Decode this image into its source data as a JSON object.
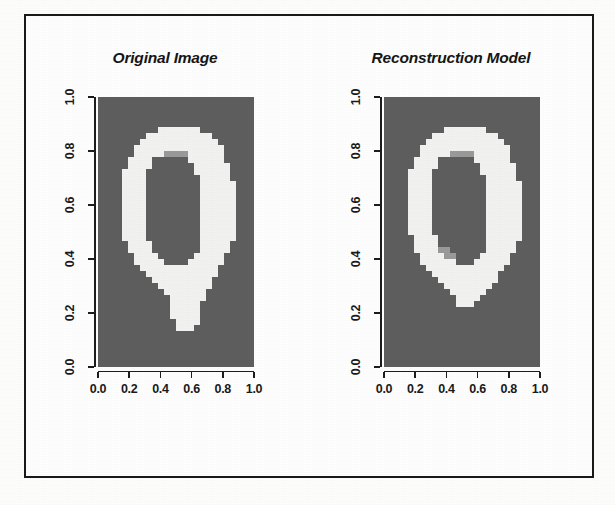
{
  "figure": {
    "panels": [
      {
        "id": "original",
        "title": "Original Image",
        "x_axis": {
          "ticks": [
            "0.0",
            "0.2",
            "0.4",
            "0.6",
            "0.8",
            "1.0"
          ],
          "min": 0.0,
          "max": 1.0
        },
        "y_axis": {
          "ticks": [
            "0.0",
            "0.2",
            "0.4",
            "0.6",
            "0.8",
            "1.0"
          ],
          "min": 0.0,
          "max": 1.0
        }
      },
      {
        "id": "reconstruction",
        "title": "Reconstruction Model",
        "x_axis": {
          "ticks": [
            "0.0",
            "0.2",
            "0.4",
            "0.6",
            "0.8",
            "1.0"
          ],
          "min": 0.0,
          "max": 1.0
        },
        "y_axis": {
          "ticks": [
            "0.0",
            "0.2",
            "0.4",
            "0.6",
            "0.8",
            "1.0"
          ],
          "min": 0.0,
          "max": 1.0
        }
      }
    ]
  },
  "colors": {
    "background_gray": "#5e5e5e",
    "stroke_white": "#f2f2f0",
    "stroke_mid": "#9a9a9a",
    "frame_black": "#1a1a1a",
    "page_white": "#fdfdfc"
  },
  "chart_data": {
    "type": "heatmap",
    "title": "",
    "xlabel": "",
    "ylabel": "",
    "xlim": [
      0.0,
      1.0
    ],
    "ylim": [
      0.0,
      1.0
    ],
    "grid": false,
    "legend": "none",
    "panels": [
      {
        "name": "Original Image",
        "x_ticks": [
          0.0,
          0.2,
          0.4,
          0.6,
          0.8,
          1.0
        ],
        "y_ticks": [
          0.0,
          0.2,
          0.4,
          0.6,
          0.8,
          1.0
        ],
        "grid_size": [
          26,
          45
        ],
        "value_levels": {
          "background": 0.0,
          "mid": 0.5,
          "stroke": 1.0
        },
        "pixels": [
          "00000000000000000000000000",
          "00000000000000000000000000",
          "00000000000000000000000000",
          "00000000000000000000000000",
          "00000000000000000000000000",
          "00000000001111111000000000",
          "00000000111111111110000000",
          "00000001111111111111000000",
          "00000011111111111111100000",
          "00000011111555511111100000",
          "00000111100000011111100000",
          "00000111100000001111110000",
          "00001111000000001111110000",
          "00001111000000000111110000",
          "00001111000000000111111000",
          "00001111000000000111111000",
          "00001111000000000111111000",
          "00001111000000000111111000",
          "00001111000000000111111000",
          "00001111000000000111111000",
          "00001111000000000111111000",
          "00001111000000000111111000",
          "00001111000000000111111000",
          "00001111000000000111111000",
          "00000111100000000111110000",
          "00000111100000000111110000",
          "00000011110000001111100000",
          "00000011111000011111100000",
          "00000001111111111111000000",
          "00000000111111111111000000",
          "00000000011111111110000000",
          "00000000001111111110000000",
          "00000000000111111100000000",
          "00000000000011111100000000",
          "00000000000011111000000000",
          "00000000000011111000000000",
          "00000000000011111000000000",
          "00000000000001111000000000",
          "00000000000001110000000000",
          "00000000000000000000000000",
          "00000000000000000000000000",
          "00000000000000000000000000",
          "00000000000000000000000000",
          "00000000000000000000000000",
          "00000000000000000000000000"
        ]
      },
      {
        "name": "Reconstruction Model",
        "x_ticks": [
          0.0,
          0.2,
          0.4,
          0.6,
          0.8,
          1.0
        ],
        "y_ticks": [
          0.0,
          0.2,
          0.4,
          0.6,
          0.8,
          1.0
        ],
        "grid_size": [
          26,
          45
        ],
        "value_levels": {
          "background": 0.0,
          "mid": 0.5,
          "stroke": 1.0
        },
        "pixels": [
          "00000000000000000000000000",
          "00000000000000000000000000",
          "00000000000000000000000000",
          "00000000000000000000000000",
          "00000000000000000000000000",
          "00000000001111111000000000",
          "00000000111111111110000000",
          "00000001111111111111000000",
          "00000011111111111111100000",
          "00000011111555511111100000",
          "00000111100000011111100000",
          "00000111100000001111110000",
          "00001111000000001111110000",
          "00001111000000000111110000",
          "00001111000000000111111000",
          "00001111000000000111111000",
          "00001111000000000111111000",
          "00001111000000000111111000",
          "00001111000000000111111000",
          "00001111000000000111111000",
          "00001111000000000111111000",
          "00001111000000000111111000",
          "00001111000000000111111000",
          "00000111100000000111111000",
          "00000111100000000111110000",
          "00000111155000000111110000",
          "00000011115500001111100000",
          "00000011111100011111100000",
          "00000001111111111111000000",
          "00000000111111111110000000",
          "00000000011111111110000000",
          "00000000001111111100000000",
          "00000000000111111000000000",
          "00000000000011110000000000",
          "00000000000011100000000000",
          "00000000000000000000000000",
          "00000000000000000000000000",
          "00000000000000000000000000",
          "00000000000000000000000000",
          "00000000000000000000000000",
          "00000000000000000000000000",
          "00000000000000000000000000",
          "00000000000000000000000000",
          "00000000000000000000000000",
          "00000000000000000000000000"
        ]
      }
    ]
  }
}
